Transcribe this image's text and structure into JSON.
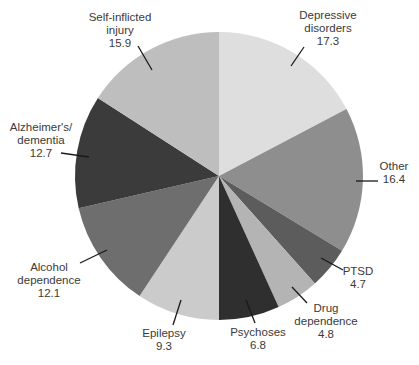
{
  "chart_data": {
    "type": "pie",
    "title": "",
    "start_angle_deg": 0,
    "direction": "clockwise",
    "slices": [
      {
        "label": "Depressive disorders",
        "value": 17.3,
        "color": "#dedede"
      },
      {
        "label": "Other",
        "value": 16.4,
        "color": "#8e8e8e"
      },
      {
        "label": "PTSD",
        "value": 4.7,
        "color": "#5c5c5c"
      },
      {
        "label": "Drug dependence",
        "value": 4.8,
        "color": "#b4b4b4"
      },
      {
        "label": "Psychoses",
        "value": 6.8,
        "color": "#2f2f2f"
      },
      {
        "label": "Epilepsy",
        "value": 9.3,
        "color": "#cbcbcb"
      },
      {
        "label": "Alcohol dependence",
        "value": 12.1,
        "color": "#6e6e6e"
      },
      {
        "label": "Alzheimer's/ dementia",
        "value": 12.7,
        "color": "#3b3b3b"
      },
      {
        "label": "Self-inflicted injury",
        "value": 15.9,
        "color": "#bebebe"
      }
    ],
    "categories": [
      "Depressive disorders",
      "Other",
      "PTSD",
      "Drug dependence",
      "Psychoses",
      "Epilepsy",
      "Alcohol dependence",
      "Alzheimer's/ dementia",
      "Self-inflicted injury"
    ],
    "values": [
      17.3,
      16.4,
      4.7,
      4.8,
      6.8,
      9.3,
      12.1,
      12.7,
      15.9
    ]
  },
  "labels": [
    {
      "lines": [
        "Depressive",
        "disorders",
        "17.3"
      ],
      "x": 328,
      "y": 9,
      "leader": [
        304,
        47,
        291,
        66
      ]
    },
    {
      "lines": [
        "Other",
        "16.4"
      ],
      "x": 394,
      "y": 160,
      "leader": [
        356,
        181,
        378,
        181
      ]
    },
    {
      "lines": [
        "PTSD",
        "4.7"
      ],
      "x": 358,
      "y": 265,
      "leader": [
        321,
        258,
        343,
        270
      ]
    },
    {
      "lines": [
        "Drug",
        "dependence",
        "4.8"
      ],
      "x": 326,
      "y": 302,
      "leader": [
        292,
        287,
        307,
        303
      ]
    },
    {
      "lines": [
        "Psychoses",
        "6.8"
      ],
      "x": 258,
      "y": 326,
      "leader": [
        246,
        300,
        255,
        323
      ]
    },
    {
      "lines": [
        "Epilepsy",
        "9.3"
      ],
      "x": 164,
      "y": 327,
      "leader": [
        181,
        300,
        173,
        325
      ]
    },
    {
      "lines": [
        "Alcohol",
        "dependence",
        "12.1"
      ],
      "x": 49,
      "y": 261,
      "leader": [
        80,
        263,
        107,
        250
      ]
    },
    {
      "lines": [
        "Alzheimer's/",
        "dementia",
        "12.7"
      ],
      "x": 41,
      "y": 121,
      "leader": [
        61,
        153,
        89,
        157
      ]
    },
    {
      "lines": [
        "Self-inflicted",
        "injury",
        "15.9"
      ],
      "x": 120,
      "y": 11,
      "leader": [
        138,
        46,
        152,
        70
      ]
    }
  ],
  "geometry": {
    "cx": 219,
    "cy": 176,
    "r": 144
  }
}
